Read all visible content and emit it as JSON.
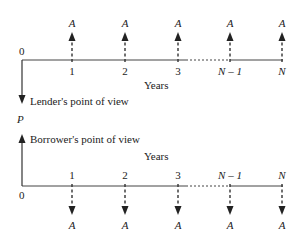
{
  "lender": {
    "caption": "Lender's point of view",
    "origin": "0",
    "axis_label": "Years",
    "ticks": [
      "1",
      "2",
      "3",
      "N – 1",
      "N"
    ],
    "flows": [
      "A",
      "A",
      "A",
      "A",
      "A"
    ]
  },
  "present_value_label": "P",
  "borrower": {
    "caption": "Borrower's point of view",
    "origin": "0",
    "axis_label": "Years",
    "ticks": [
      "1",
      "2",
      "3",
      "N – 1",
      "N"
    ],
    "flows": [
      "A",
      "A",
      "A",
      "A",
      "A"
    ]
  }
}
